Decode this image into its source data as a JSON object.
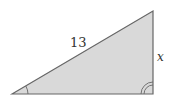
{
  "diagram": {
    "type": "right-triangle",
    "fill_color": "#d9d9d9",
    "stroke_color": "#666666",
    "hypotenuse_label": "13",
    "vertical_side_label": "x",
    "angle_mark_left": "single-arc",
    "angle_mark_right": "double-arc"
  }
}
